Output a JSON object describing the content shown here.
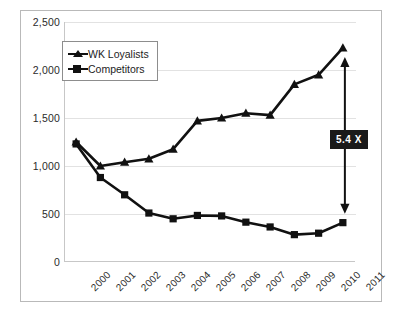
{
  "chart_data": {
    "type": "line",
    "title": "",
    "xlabel": "",
    "ylabel": "",
    "grid": true,
    "legend_position": "top-left-inside",
    "categories": [
      "2000",
      "2001",
      "2002",
      "2003",
      "2004",
      "2005",
      "2006",
      "2007",
      "2008",
      "2009",
      "2010",
      "2011"
    ],
    "ylim": [
      0,
      2500
    ],
    "yticks": [
      0,
      500,
      1000,
      1500,
      2000,
      2500
    ],
    "ytick_labels": [
      "0",
      "500",
      "1,000",
      "1,500",
      "2,000",
      "2,500"
    ],
    "series": [
      {
        "name": "WK Loyalists",
        "marker": "triangle",
        "color": "#111111",
        "values": [
          1250,
          1000,
          1040,
          1075,
          1175,
          1470,
          1500,
          1550,
          1530,
          1850,
          1950,
          2230
        ]
      },
      {
        "name": "Competitors",
        "marker": "square",
        "color": "#111111",
        "values": [
          1230,
          880,
          700,
          510,
          450,
          485,
          480,
          415,
          365,
          285,
          300,
          410
        ]
      }
    ],
    "annotations": [
      {
        "name": "ratio-callout",
        "label": "5.4 X",
        "at_category": "2011",
        "from_value": 2230,
        "to_value": 410,
        "style": "double-headed-arrow"
      }
    ]
  },
  "legend": {
    "items": [
      {
        "label": "WK Loyalists"
      },
      {
        "label": "Competitors"
      }
    ]
  }
}
